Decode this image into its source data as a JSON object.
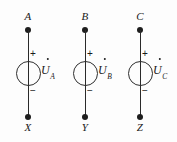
{
  "figure": {
    "background_color": "#fdfdfd",
    "line_color": "#2a2a2a",
    "text_color": "#1a1a1a"
  },
  "branches": [
    {
      "top_terminal": "A",
      "bottom_terminal": "X",
      "plus_sign": "+",
      "minus_sign": "−",
      "phasor_symbol": "U",
      "phasor_subscript": "A",
      "phasor_full": "U̇A"
    },
    {
      "top_terminal": "B",
      "bottom_terminal": "Y",
      "plus_sign": "+",
      "minus_sign": "−",
      "phasor_symbol": "U",
      "phasor_subscript": "B",
      "phasor_full": "U̇B"
    },
    {
      "top_terminal": "C",
      "bottom_terminal": "Z",
      "plus_sign": "+",
      "minus_sign": "−",
      "phasor_symbol": "U",
      "phasor_subscript": "C",
      "phasor_full": "U̇C"
    }
  ]
}
